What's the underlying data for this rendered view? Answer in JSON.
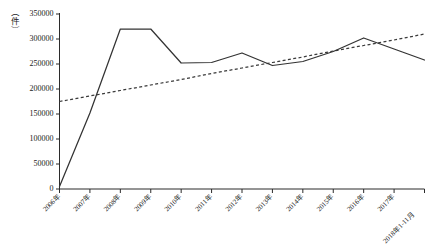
{
  "chart_data": {
    "type": "line",
    "title": "",
    "xlabel": "",
    "ylabel": "（件）",
    "ylim": [
      0,
      350000
    ],
    "ytick_step": 50000,
    "grid": false,
    "legend": "none",
    "categories": [
      "2006年",
      "2007年",
      "2008年",
      "2009年",
      "2010年",
      "2011年",
      "2012年",
      "2013年",
      "2014年",
      "2015年",
      "2016年",
      "2017年",
      "2018年1-11月"
    ],
    "ytick_labels": [
      "0",
      "50000",
      "100000",
      "150000",
      "200000",
      "250000",
      "300000",
      "350000"
    ],
    "ytick_values": [
      0,
      50000,
      100000,
      150000,
      200000,
      250000,
      300000,
      350000
    ],
    "series": [
      {
        "name": "件数",
        "style": "solid",
        "color": "#333333",
        "values": [
          5000,
          152000,
          320000,
          320000,
          252000,
          253000,
          272000,
          247000,
          255000,
          275000,
          302000,
          280000,
          258000
        ]
      },
      {
        "name": "趋势线",
        "style": "dashed",
        "color": "#3a3a3a",
        "values": [
          175000,
          186000,
          197000,
          208000,
          219000,
          231000,
          242000,
          253000,
          264000,
          276000,
          287000,
          298000,
          310000
        ]
      }
    ]
  },
  "colors": {
    "axis": "#2b2b2b",
    "series": "#333333",
    "trend": "#3a3a3a",
    "background": "#ffffff"
  }
}
